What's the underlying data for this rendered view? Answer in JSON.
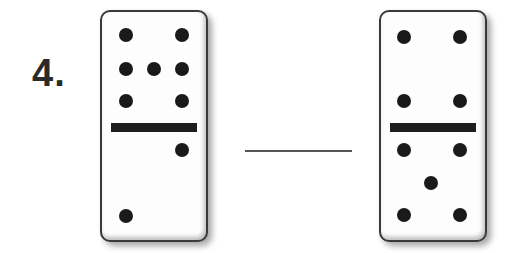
{
  "problem": {
    "number_label": "4.",
    "dominoes": [
      {
        "name": "domino-left",
        "top_pips": 7,
        "bottom_pips": 2,
        "top_pip_positions": [
          [
            26,
            25
          ],
          [
            82,
            25
          ],
          [
            26,
            59
          ],
          [
            54,
            59
          ],
          [
            82,
            59
          ],
          [
            26,
            91
          ],
          [
            82,
            91
          ]
        ],
        "bottom_pip_positions": [
          [
            82,
            140
          ],
          [
            26,
            206
          ]
        ]
      },
      {
        "name": "domino-right",
        "top_pips": 4,
        "bottom_pips": 5,
        "top_pip_positions": [
          [
            25,
            27
          ],
          [
            81,
            27
          ],
          [
            25,
            91
          ],
          [
            81,
            91
          ]
        ],
        "bottom_pip_positions": [
          [
            25,
            140
          ],
          [
            81,
            140
          ],
          [
            52,
            173
          ],
          [
            25,
            205
          ],
          [
            81,
            205
          ]
        ]
      }
    ],
    "answer_blank": ""
  }
}
